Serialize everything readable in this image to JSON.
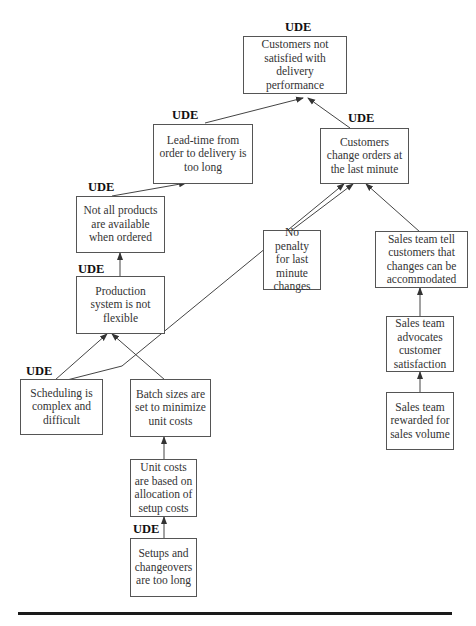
{
  "diagram": {
    "type": "current reality tree",
    "ude_label": "UDE",
    "nodes": [
      {
        "id": "n1",
        "text": "Customers not satisfied with delivery performance",
        "ude": true
      },
      {
        "id": "n2",
        "text": "Lead-time from order to delivery is too long",
        "ude": true
      },
      {
        "id": "n3",
        "text": "Customers change orders at the last minute",
        "ude": true
      },
      {
        "id": "n4",
        "text": "Not all products are available when ordered",
        "ude": true
      },
      {
        "id": "n5",
        "text": "Production system is not flexible",
        "ude": true
      },
      {
        "id": "n6",
        "text": "Scheduling is complex and difficult",
        "ude": true
      },
      {
        "id": "n7",
        "text": "Batch sizes are set to minimize unit costs",
        "ude": false
      },
      {
        "id": "n8",
        "text": "Unit costs are based on allocation of setup costs",
        "ude": false
      },
      {
        "id": "n9",
        "text": "Setups and changeovers are too long",
        "ude": true
      },
      {
        "id": "n10",
        "text": "No penalty for last minute changes",
        "ude": false
      },
      {
        "id": "n11",
        "text": "Sales team tell customers that changes can be accommodated",
        "ude": false
      },
      {
        "id": "n12",
        "text": "Sales team advocates customer satisfaction",
        "ude": false
      },
      {
        "id": "n13",
        "text": "Sales team rewarded for sales volume",
        "ude": false
      }
    ],
    "edges": [
      {
        "from": "n2",
        "to": "n1"
      },
      {
        "from": "n3",
        "to": "n1"
      },
      {
        "from": "n4",
        "to": "n2"
      },
      {
        "from": "n5",
        "to": "n4"
      },
      {
        "from": "n6",
        "to": "n5"
      },
      {
        "from": "n7",
        "to": "n5"
      },
      {
        "from": "n6",
        "to": "n3"
      },
      {
        "from": "n8",
        "to": "n7"
      },
      {
        "from": "n9",
        "to": "n8"
      },
      {
        "from": "n10",
        "to": "n3"
      },
      {
        "from": "n11",
        "to": "n3"
      },
      {
        "from": "n12",
        "to": "n11"
      },
      {
        "from": "n13",
        "to": "n12"
      }
    ]
  },
  "colors": {
    "line": "#444444",
    "border": "#555555",
    "rule": "#1a1a1a"
  }
}
